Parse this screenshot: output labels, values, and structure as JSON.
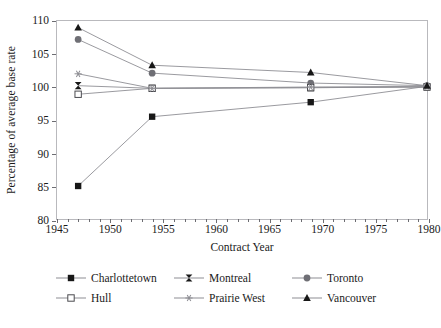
{
  "chart_data": {
    "type": "line",
    "title": "",
    "xlabel": "Contract Year",
    "ylabel": "Percentage of average base rate",
    "xlim": [
      1945,
      1980
    ],
    "ylim": [
      80,
      110
    ],
    "xticks": [
      1945,
      1950,
      1955,
      1960,
      1965,
      1970,
      1975,
      1980
    ],
    "xtick_labels": [
      "1945",
      "1950",
      "1955",
      "1960",
      "1965",
      "1970",
      "1975",
      "1980"
    ],
    "yticks": [
      80,
      85,
      90,
      95,
      100,
      105,
      110
    ],
    "ytick_labels": [
      "80",
      "85",
      "90",
      "95",
      "100",
      "105",
      "110"
    ],
    "x": [
      1947,
      1954,
      1969,
      1980
    ],
    "grid": false,
    "legend_position": "below",
    "series": [
      {
        "name": "Charlottetown",
        "marker": "filled-square",
        "color": "#171717",
        "values": [
          85.0,
          95.5,
          97.7,
          100.1
        ]
      },
      {
        "name": "Montreal",
        "marker": "bowtie",
        "color": "#171717",
        "values": [
          100.2,
          99.8,
          99.9,
          100.0
        ]
      },
      {
        "name": "Toronto",
        "marker": "filled-circle",
        "color": "#6f6f75",
        "values": [
          107.2,
          102.1,
          100.6,
          100.2
        ]
      },
      {
        "name": "Hull",
        "marker": "open-square",
        "color": "#4a4a4f",
        "values": [
          98.9,
          99.8,
          99.9,
          100.0
        ]
      },
      {
        "name": "Prairie West",
        "marker": "asterisk",
        "color": "#8d8d93",
        "values": [
          102.0,
          99.8,
          100.0,
          100.1
        ]
      },
      {
        "name": "Vancouver",
        "marker": "filled-triangle",
        "color": "#171717",
        "values": [
          109.0,
          103.3,
          102.2,
          100.2
        ]
      }
    ],
    "line_color": "#8d8d93",
    "axis_color": "#b9b9bd"
  },
  "legend": {
    "items": [
      {
        "label": "Charlottetown",
        "marker": "filled-square"
      },
      {
        "label": "Montreal",
        "marker": "bowtie"
      },
      {
        "label": "Toronto",
        "marker": "filled-circle"
      },
      {
        "label": "Hull",
        "marker": "open-square"
      },
      {
        "label": "Prairie West",
        "marker": "asterisk"
      },
      {
        "label": "Vancouver",
        "marker": "filled-triangle"
      }
    ]
  }
}
